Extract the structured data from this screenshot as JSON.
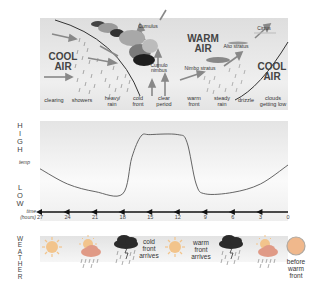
{
  "front_diagram": {
    "left_air": "COOL\nAIR",
    "center_air": "WARM\nAIR",
    "right_air": "COOL\nAIR",
    "cloud_labels": [
      "Cumulus",
      "Cumulo\nnimbus",
      "Nimbo stratus",
      "Alto stratus",
      "Cirrus"
    ],
    "stages": [
      "clearing",
      "showers",
      "heavy\nrain",
      "cold\nfront",
      "clear\nperiod",
      "warm\nfront",
      "steady\nrain",
      "drizzle",
      "clouds\ngetting low"
    ]
  },
  "temp_graph": {
    "high_label": "HIGH",
    "low_label": "LOW",
    "y_label": "temp",
    "x_label": "time\n(hours)",
    "time_ticks": [
      "27",
      "24",
      "21",
      "18",
      "15",
      "12",
      "9",
      "6",
      "3",
      "0"
    ]
  },
  "chart_data": {
    "type": "line",
    "title": "",
    "xlabel": "time (hours)",
    "ylabel": "temp",
    "x": [
      27,
      24,
      21,
      18,
      17,
      16,
      15,
      12,
      11,
      10,
      9,
      6,
      3,
      0
    ],
    "values": [
      0.45,
      0.25,
      0.15,
      0.12,
      0.6,
      0.88,
      0.9,
      0.9,
      0.8,
      0.25,
      0.12,
      0.14,
      0.25,
      0.5
    ],
    "xlim": [
      27,
      0
    ],
    "ylim": [
      0,
      1
    ],
    "y_scale_labels": [
      "LOW",
      "HIGH"
    ],
    "grid": false
  },
  "weather": {
    "side_label": "WEATHER",
    "icons": [
      "sun-icon",
      "sun-cloud-rain-icon",
      "thunderstorm-icon",
      "sun-icon",
      "thunderstorm-icon",
      "sun-cloud-rain-icon",
      "overcast-disc-icon"
    ],
    "labels": [
      "cold\nfront\narrives",
      "warm\nfront\narrives",
      "before\nwarm\nfront"
    ]
  }
}
